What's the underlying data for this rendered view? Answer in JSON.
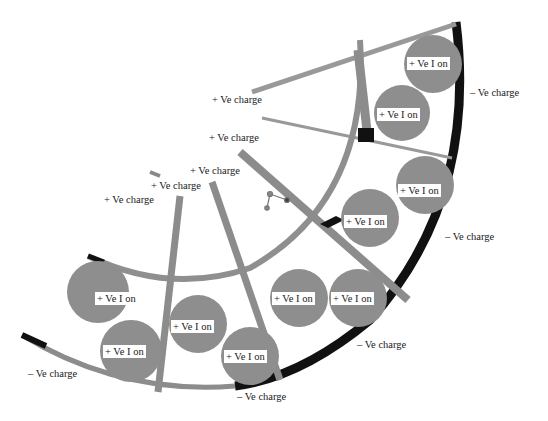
{
  "diagram": {
    "type": "ion-channel-cross-section",
    "colors": {
      "outer_wall": "#111111",
      "strut": "#8c8c8c",
      "inner_arc": "#8f8f8f",
      "ion_sphere": "#8e8e8e",
      "junction": "#111111",
      "background": "#ffffff"
    },
    "positive_charge_labels": [
      {
        "text": "+ Ve  charge",
        "x": 212,
        "y": 94
      },
      {
        "text": "+ Ve  charge",
        "x": 209,
        "y": 132
      },
      {
        "text": "+ Ve  charge",
        "x": 190,
        "y": 165
      },
      {
        "text": "+ Ve  charge",
        "x": 151,
        "y": 180
      },
      {
        "text": "+ Ve  charge",
        "x": 104,
        "y": 194
      }
    ],
    "negative_charge_labels": [
      {
        "text": "– Ve  charge",
        "x": 468,
        "y": 87
      },
      {
        "text": "– Ve  charge",
        "x": 443,
        "y": 231
      },
      {
        "text": "– Ve  charge",
        "x": 355,
        "y": 339
      },
      {
        "text": "– Ve  charge",
        "x": 26,
        "y": 368
      },
      {
        "text": "– Ve  charge",
        "x": 235,
        "y": 391
      }
    ],
    "ions": [
      {
        "label": "+ Ve  I on",
        "cx": 433,
        "cy": 64,
        "r": 29,
        "lx": 407,
        "ly": 57
      },
      {
        "label": "+ Ve  I on",
        "cx": 402,
        "cy": 113,
        "r": 28,
        "lx": 377,
        "ly": 108
      },
      {
        "label": "+ Ve  I on",
        "cx": 425,
        "cy": 185,
        "r": 29,
        "lx": 398,
        "ly": 184
      },
      {
        "label": "+ Ve  I on",
        "cx": 370,
        "cy": 218,
        "r": 29,
        "lx": 344,
        "ly": 215
      },
      {
        "label": "+ Ve  I on",
        "cx": 98,
        "cy": 292,
        "r": 31,
        "lx": 95,
        "ly": 292
      },
      {
        "label": "+ Ve  I on",
        "cx": 131,
        "cy": 351,
        "r": 31,
        "lx": 103,
        "ly": 345
      },
      {
        "label": "+ Ve  I on",
        "cx": 198,
        "cy": 324,
        "r": 29,
        "lx": 171,
        "ly": 320
      },
      {
        "label": "+ Ve  I on",
        "cx": 250,
        "cy": 356,
        "r": 29,
        "lx": 224,
        "ly": 350
      },
      {
        "label": "+ Ve  I on",
        "cx": 299,
        "cy": 298,
        "r": 29,
        "lx": 272,
        "ly": 292
      },
      {
        "label": "+ Ve  I on",
        "cx": 358,
        "cy": 298,
        "r": 29,
        "lx": 331,
        "ly": 292
      }
    ]
  }
}
